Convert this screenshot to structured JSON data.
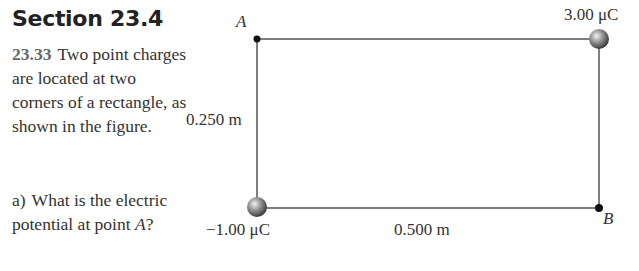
{
  "section": {
    "title": "Section 23.4"
  },
  "problem": {
    "number": "23.33",
    "text": "Two point charges are located at two corners of a rectangle, as shown in the figure."
  },
  "question": {
    "label": "a)",
    "text_before": "What is the electric potential at point ",
    "point": "A",
    "text_after": "?"
  },
  "figure": {
    "point_a_label": "A",
    "point_b_label": "B",
    "charge_top_right": "3.00 μC",
    "charge_bottom_left": "−1.00 μC",
    "height_label": "0.250 m",
    "width_label": "0.500 m",
    "colors": {
      "line": "#555555",
      "dot": "#111111",
      "sphere": "#8a8a8a"
    }
  }
}
